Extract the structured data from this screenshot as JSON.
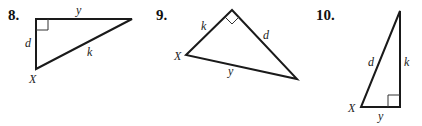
{
  "problems": [
    {
      "number": "8.",
      "labels": {
        "top": "y",
        "left": "d",
        "hyp": "k",
        "vertex": "X"
      }
    },
    {
      "number": "9.",
      "labels": {
        "left_leg": "k",
        "right_leg": "d",
        "hyp": "y",
        "vertex": "X"
      }
    },
    {
      "number": "10.",
      "labels": {
        "hyp": "d",
        "right": "k",
        "bottom": "y",
        "vertex": "X"
      }
    }
  ],
  "colors": {
    "line": "#1a1a1a",
    "background": "#ffffff"
  }
}
